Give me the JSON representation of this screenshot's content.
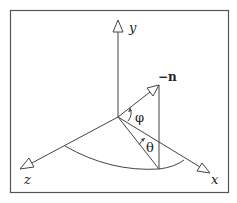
{
  "diagram": {
    "type": "3d-coordinate-axes",
    "axes": [
      {
        "name": "y",
        "label": "y"
      },
      {
        "name": "z",
        "label": "z"
      },
      {
        "name": "x",
        "label": "x"
      }
    ],
    "vector": {
      "label": "−n"
    },
    "angles": [
      {
        "name": "phi",
        "label": "φ"
      },
      {
        "name": "theta",
        "label": "θ"
      }
    ],
    "colors": {
      "stroke": "#444444",
      "frame": "#555555",
      "text": "#222222"
    }
  }
}
